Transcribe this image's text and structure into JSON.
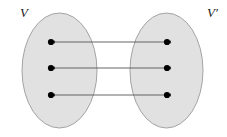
{
  "figure": {
    "type": "set-mapping-diagram",
    "width": 227,
    "height": 137,
    "background_color": "#ffffff"
  },
  "colors": {
    "ellipse_fill": "#e1e1e1",
    "ellipse_stroke": "#9a9a9a",
    "line_stroke": "#555555",
    "dot_fill": "#000000",
    "label_color": "#1a1a1a"
  },
  "sets": [
    {
      "id": "domain-set",
      "label": "V",
      "label_x": 20,
      "label_y": 17,
      "cx": 59.5,
      "cy": 70.5,
      "rx": 37.5,
      "ry": 57.5
    },
    {
      "id": "codomain-set",
      "label": "V′",
      "label_x": 207,
      "label_y": 17,
      "cx": 166.5,
      "cy": 70.5,
      "rx": 36.5,
      "ry": 57.5
    }
  ],
  "nodes": [
    {
      "id": "v1",
      "set": "domain-set",
      "cx": 51,
      "cy": 42,
      "r": 3.1
    },
    {
      "id": "v2",
      "set": "domain-set",
      "cx": 51,
      "cy": 68,
      "r": 3.1
    },
    {
      "id": "v3",
      "set": "domain-set",
      "cx": 51,
      "cy": 95,
      "r": 3.1
    },
    {
      "id": "v1p",
      "set": "codomain-set",
      "cx": 167,
      "cy": 42,
      "r": 3.1
    },
    {
      "id": "v2p",
      "set": "codomain-set",
      "cx": 167,
      "cy": 68,
      "r": 3.1
    },
    {
      "id": "v3p",
      "set": "codomain-set",
      "cx": 167,
      "cy": 95,
      "r": 3.1
    }
  ],
  "edges": [
    {
      "id": "edge-1",
      "from": "v1p",
      "to": "v1",
      "x1": 167,
      "y1": 42,
      "x2": 51,
      "y2": 42,
      "double_headed": true
    },
    {
      "id": "edge-2",
      "from": "v2p",
      "to": "v2",
      "x1": 167,
      "y1": 68,
      "x2": 51,
      "y2": 68,
      "double_headed": true
    },
    {
      "id": "edge-3",
      "from": "v3p",
      "to": "v3",
      "x1": 167,
      "y1": 95,
      "x2": 51,
      "y2": 95,
      "double_headed": true
    }
  ]
}
